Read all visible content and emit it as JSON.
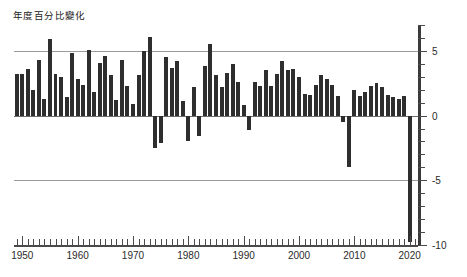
{
  "chart_data": {
    "type": "bar",
    "title": "年度百分比變化",
    "xlabel": "",
    "ylabel": "",
    "ylim": [
      -10,
      7
    ],
    "xlim": [
      1948.5,
      2021.5
    ],
    "grid": true,
    "gridlines": [
      5,
      0,
      -5
    ],
    "legend": null,
    "bar_color": "#2e2e2e",
    "axis_color": "#4a4a4a",
    "grid_color": "#9b9b9b",
    "yticks": [
      5,
      0,
      -5,
      -10
    ],
    "ytick_labels": [
      "5",
      "0",
      "-5",
      "-10"
    ],
    "ytick_minor_step": 1,
    "xticks": [
      1950,
      1960,
      1970,
      1980,
      1990,
      2000,
      2010,
      2020
    ],
    "xtick_labels": [
      "1950",
      "1960",
      "1970",
      "1980",
      "1990",
      "2000",
      "2010",
      "2020"
    ],
    "xtick_minor_step": 1,
    "x": [
      1949,
      1950,
      1951,
      1952,
      1953,
      1954,
      1955,
      1956,
      1957,
      1958,
      1959,
      1960,
      1961,
      1962,
      1963,
      1964,
      1965,
      1966,
      1967,
      1968,
      1969,
      1970,
      1971,
      1972,
      1973,
      1974,
      1975,
      1976,
      1977,
      1978,
      1979,
      1980,
      1981,
      1982,
      1983,
      1984,
      1985,
      1986,
      1987,
      1988,
      1989,
      1990,
      1991,
      1992,
      1993,
      1994,
      1995,
      1996,
      1997,
      1998,
      1999,
      2000,
      2001,
      2002,
      2003,
      2004,
      2005,
      2006,
      2007,
      2008,
      2009,
      2010,
      2011,
      2012,
      2013,
      2014,
      2015,
      2016,
      2017,
      2018,
      2019,
      2020
    ],
    "values": [
      3.2,
      3.2,
      3.6,
      2.0,
      4.3,
      1.3,
      5.9,
      3.2,
      3.0,
      1.4,
      4.8,
      2.8,
      2.4,
      5.1,
      1.8,
      4.1,
      4.6,
      3.1,
      1.2,
      4.3,
      2.3,
      0.9,
      3.1,
      5.0,
      6.1,
      -2.5,
      -2.1,
      4.5,
      3.7,
      4.2,
      1.1,
      -2.0,
      2.2,
      -1.6,
      3.8,
      5.5,
      3.1,
      2.2,
      3.3,
      4.0,
      2.6,
      0.8,
      -1.1,
      2.6,
      2.3,
      3.5,
      2.3,
      3.2,
      4.2,
      3.5,
      3.6,
      3.0,
      1.7,
      1.6,
      2.4,
      3.1,
      2.8,
      2.4,
      1.5,
      -0.5,
      -4.0,
      2.0,
      1.5,
      1.8,
      2.3,
      2.5,
      2.2,
      1.6,
      1.4,
      1.3,
      1.5,
      -9.8
    ]
  }
}
